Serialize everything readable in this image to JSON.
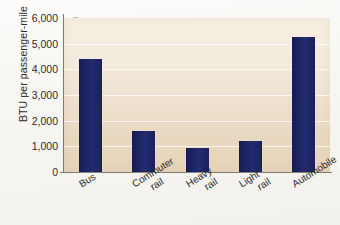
{
  "chart_data": {
    "type": "bar",
    "title": "",
    "xlabel": "",
    "ylabel": "BTU per passenger-mile",
    "categories": [
      "Bus",
      "Commuter rail",
      "Heavy rail",
      "Light rail",
      "Automobile"
    ],
    "category_lines": [
      [
        "Bus"
      ],
      [
        "Commuter",
        "rail"
      ],
      [
        "Heavy",
        "rail"
      ],
      [
        "Light",
        "rail"
      ],
      [
        "Automobile"
      ]
    ],
    "values": [
      4400,
      1600,
      950,
      1200,
      5250
    ],
    "ylim": [
      0,
      6000
    ],
    "ytick_labels": [
      "6,000",
      "5,000",
      "4,000",
      "3,000",
      "2,000",
      "1,000",
      "0"
    ],
    "ytick_values": [
      6000,
      5000,
      4000,
      3000,
      2000,
      1000,
      0
    ],
    "grid": true,
    "legend": "none",
    "bar_color": "#1d2462",
    "plot_background": "#efe2cd"
  }
}
